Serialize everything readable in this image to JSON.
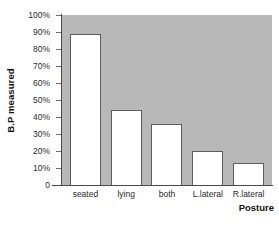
{
  "chart_data": {
    "type": "bar",
    "title": "",
    "xlabel": "Posture",
    "ylabel": "B.P measured",
    "categories": [
      "seated",
      "lying",
      "both",
      "L.lateral",
      "R.lateral"
    ],
    "values": [
      89,
      44,
      36,
      20,
      13
    ],
    "ylim": [
      0,
      100
    ],
    "ytick_labels": [
      "100%",
      "90%",
      "80%",
      "70%",
      "60%",
      "50%",
      "40%",
      "30%",
      "20%",
      "10%",
      "0"
    ],
    "ytick_values": [
      100,
      90,
      80,
      70,
      60,
      50,
      40,
      30,
      20,
      10,
      0
    ],
    "grid": false,
    "legend": false,
    "colors": {
      "plot_background": "#b8b8b8",
      "bar_fill": "#ffffff",
      "bar_outline": "#5d5d5d",
      "axis": "#4a4a4a",
      "text": "#1a1a1a",
      "figure_background": "#ffffff"
    }
  }
}
